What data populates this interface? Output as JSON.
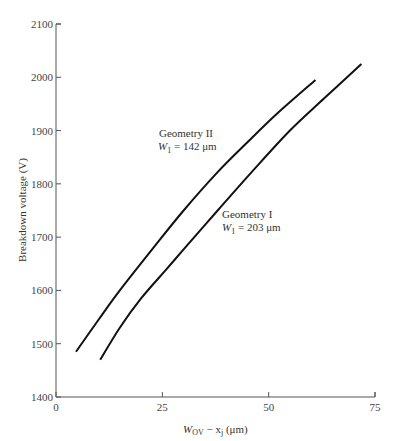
{
  "chart_data": {
    "type": "line",
    "title": "",
    "xlabel": "W_OV − x_j (μm)",
    "xlabel_main": "W",
    "xlabel_sub": "OV",
    "xlabel_rest": " − x",
    "xlabel_sub2": "j",
    "xlabel_unit": " (μm)",
    "ylabel": "Breakdown voltage (V)",
    "xlim": [
      0,
      75
    ],
    "ylim": [
      1400,
      2100
    ],
    "xticks": [
      0,
      25,
      50,
      75
    ],
    "yticks": [
      1400,
      1500,
      1600,
      1700,
      1800,
      1900,
      2000,
      2100
    ],
    "grid": false,
    "legend": "inline annotations",
    "series": [
      {
        "name": "Geometry II",
        "annotation_line1": "Geometry II",
        "annotation_line2": "W₁ = 142 μm",
        "x": [
          4.7,
          10,
          15,
          22.6,
          30,
          38,
          45,
          52,
          61
        ],
        "y": [
          1485,
          1545,
          1600,
          1677,
          1750,
          1822,
          1878,
          1932,
          1995
        ]
      },
      {
        "name": "Geometry I",
        "annotation_line1": "Geometry I",
        "annotation_line2": "W₁ = 203 μm",
        "x": [
          10.4,
          15,
          20,
          26,
          30,
          38,
          46,
          55,
          63,
          71.8
        ],
        "y": [
          1470,
          1530,
          1585,
          1640,
          1677,
          1750,
          1822,
          1900,
          1960,
          2025
        ]
      }
    ]
  },
  "axis": {
    "y_title": "Breakdown voltage (V)",
    "x_title_W": "W",
    "x_title_OV": "OV",
    "x_title_minus": " − x",
    "x_title_j": "j",
    "x_title_unit": " (μm)"
  },
  "annotations": {
    "geom2_line1": "Geometry II",
    "geom2_line2_W": "W",
    "geom2_line2_sub": "1",
    "geom2_line2_rest": " = 142 μm",
    "geom1_line1": "Geometry I",
    "geom1_line2_W": "W",
    "geom1_line2_sub": "1",
    "geom1_line2_rest": " = 203 μm"
  }
}
